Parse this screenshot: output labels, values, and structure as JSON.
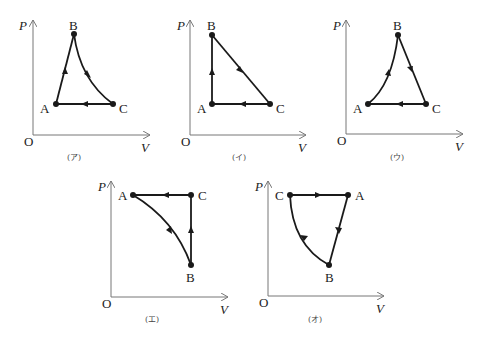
{
  "diagrams": [
    {
      "caption": "(ア)",
      "axis": {
        "y_label": "P",
        "x_label": "V",
        "origin_label": "O"
      },
      "points": {
        "A": "A",
        "B": "B",
        "C": "C"
      },
      "description": "A→B straight up-right, B→C curved down-right, C→A horizontal left"
    },
    {
      "caption": "(イ)",
      "axis": {
        "y_label": "P",
        "x_label": "V",
        "origin_label": "O"
      },
      "points": {
        "A": "A",
        "B": "B",
        "C": "C"
      },
      "description": "A→B vertical up, B→C straight diagonal, C→A horizontal left"
    },
    {
      "caption": "(ウ)",
      "axis": {
        "y_label": "P",
        "x_label": "V",
        "origin_label": "O"
      },
      "points": {
        "A": "A",
        "B": "B",
        "C": "C"
      },
      "description": "A→B curved up, B→C straight down-right, C→A horizontal left"
    },
    {
      "caption": "(エ)",
      "axis": {
        "y_label": "P",
        "x_label": "V",
        "origin_label": "O"
      },
      "points": {
        "A": "A",
        "B": "B",
        "C": "C"
      },
      "description": "A→B curved down-right, B→C vertical up, C→A horizontal left"
    },
    {
      "caption": "(オ)",
      "axis": {
        "y_label": "P",
        "x_label": "V",
        "origin_label": "O"
      },
      "points": {
        "A": "A",
        "B": "B",
        "C": "C"
      },
      "description": "C→A horizontal right, A→B straight down-left, B→C curved up-left"
    }
  ],
  "colors": {
    "line": "#1a1a1a",
    "axis": "#777777",
    "background": "#ffffff"
  }
}
